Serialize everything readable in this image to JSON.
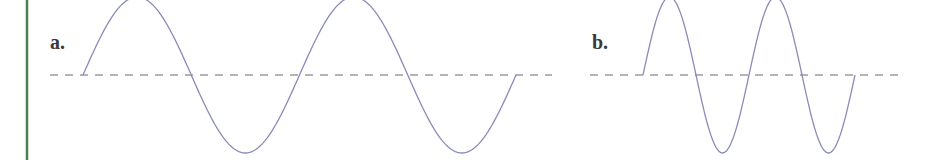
{
  "border": {
    "color": "#4f7f4f"
  },
  "colors": {
    "wave": "#8a8ab8",
    "axis": "#6a6a6a",
    "label": "#3a3a3a"
  },
  "panels": [
    {
      "label": "a.",
      "label_pos": [
        50,
        49
      ],
      "axis": {
        "x1": 50,
        "x2": 552,
        "y": 75
      },
      "wave": {
        "x_start": 83,
        "x_end": 516,
        "cycles": 2,
        "amplitude": 78,
        "baseline": 75
      }
    },
    {
      "label": "b.",
      "label_pos": [
        592,
        49
      ],
      "axis": {
        "x1": 590,
        "x2": 903,
        "y": 75
      },
      "wave": {
        "x_start": 643,
        "x_end": 855,
        "cycles": 2,
        "amplitude": 78,
        "baseline": 75
      }
    }
  ]
}
